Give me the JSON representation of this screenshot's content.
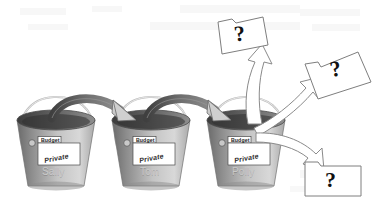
{
  "diagram": {
    "type": "flow-diagram",
    "background_color": "#ffffff"
  },
  "buckets": [
    {
      "id": "bucket-sally",
      "owner": "Sally",
      "card": {
        "tab_label": "Budget",
        "stamp_label": "Private"
      }
    },
    {
      "id": "bucket-tom",
      "owner": "Tom",
      "card": {
        "tab_label": "Budget",
        "stamp_label": "Private"
      }
    },
    {
      "id": "bucket-polly",
      "owner": "Polly",
      "card": {
        "tab_label": "Budget",
        "stamp_label": "Private"
      }
    }
  ],
  "documents": [
    {
      "id": "doc-top",
      "label": "?"
    },
    {
      "id": "doc-right",
      "label": "?"
    },
    {
      "id": "doc-bottom",
      "label": "?"
    }
  ],
  "arrows": {
    "transfer": [
      {
        "id": "arrow-sally-to-tom",
        "from": "Sally",
        "to": "Tom",
        "style": "solid-dark"
      },
      {
        "id": "arrow-tom-to-polly",
        "from": "Tom",
        "to": "Polly",
        "style": "solid-dark"
      }
    ],
    "unknown": [
      {
        "id": "arrow-polly-to-doc-top",
        "from": "Polly",
        "to": "?",
        "style": "outline-white"
      },
      {
        "id": "arrow-polly-to-doc-right",
        "from": "Polly",
        "to": "?",
        "style": "outline-white"
      },
      {
        "id": "arrow-polly-to-doc-bottom",
        "from": "Polly",
        "to": "?",
        "style": "outline-white"
      }
    ]
  },
  "colors": {
    "bucket_dark": "#6e6e6e",
    "bucket_light": "#d2d2d2",
    "bucket_rim": "#4a4a4a",
    "arrow_dark": "#555555",
    "arrow_head": "#c0c0c0",
    "outline": "#8a8a8a",
    "card_fill": "#ffffff",
    "ink": "#111111"
  }
}
